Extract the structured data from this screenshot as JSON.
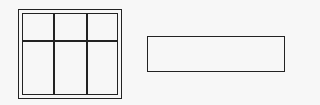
{
  "diagram": {
    "shapes": [
      {
        "type": "framed-grid",
        "label": "",
        "columns": 3,
        "rows": 2
      },
      {
        "type": "rectangle",
        "label": ""
      }
    ],
    "colors": {
      "stroke": "#222222",
      "background": "#f7f7f7"
    }
  }
}
